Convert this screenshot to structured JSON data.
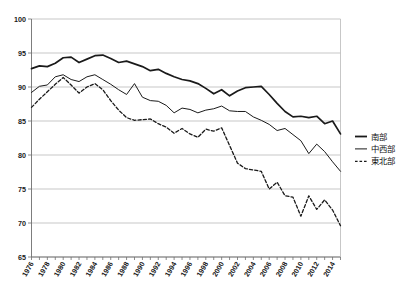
{
  "chart_data": {
    "type": "line",
    "title": "",
    "subtitle": "",
    "xlabel": "",
    "ylabel": "",
    "xlim": [
      1976,
      2015
    ],
    "ylim": [
      65,
      100
    ],
    "y_ticks": [
      65,
      70,
      75,
      80,
      85,
      90,
      95,
      100
    ],
    "grid": true,
    "legend_position": "right",
    "x_tick_labels": [
      "1976",
      "1978",
      "1980",
      "1982",
      "1984",
      "1986",
      "1988",
      "1990",
      "1992",
      "1994",
      "1996",
      "1998",
      "2000",
      "2002",
      "2004",
      "2006",
      "2008",
      "2010",
      "2012",
      "2014"
    ],
    "x": [
      1976,
      1977,
      1978,
      1979,
      1980,
      1981,
      1982,
      1983,
      1984,
      1985,
      1986,
      1987,
      1988,
      1989,
      1990,
      1991,
      1992,
      1993,
      1994,
      1995,
      1996,
      1997,
      1998,
      1999,
      2000,
      2001,
      2002,
      2003,
      2004,
      2005,
      2006,
      2007,
      2008,
      2009,
      2010,
      2011,
      2012,
      2013,
      2014,
      2015
    ],
    "series": [
      {
        "name": "南部",
        "style": "solid-thick",
        "color": "#1a1a1a",
        "values": [
          92.7,
          93.1,
          93.0,
          93.5,
          94.3,
          94.4,
          93.6,
          94.1,
          94.6,
          94.7,
          94.2,
          93.6,
          93.8,
          93.4,
          93.0,
          92.4,
          92.6,
          92.0,
          91.5,
          91.1,
          90.9,
          90.5,
          89.8,
          89.0,
          89.6,
          88.7,
          89.4,
          89.9,
          90.0,
          90.1,
          88.9,
          87.6,
          86.4,
          85.6,
          85.7,
          85.5,
          85.7,
          84.6,
          85.0,
          83.1
        ]
      },
      {
        "name": "中西部",
        "style": "solid-thin",
        "color": "#1a1a1a",
        "values": [
          89.2,
          90.1,
          90.3,
          91.5,
          91.8,
          91.1,
          90.8,
          91.5,
          91.8,
          91.1,
          90.4,
          89.6,
          88.9,
          90.5,
          88.5,
          88.0,
          87.9,
          87.3,
          86.2,
          86.9,
          86.7,
          86.2,
          86.6,
          86.8,
          87.2,
          86.5,
          86.4,
          86.4,
          85.6,
          85.1,
          84.5,
          83.6,
          83.9,
          83.0,
          82.1,
          80.2,
          81.6,
          80.5,
          79.0,
          77.6
        ]
      },
      {
        "name": "東北部",
        "style": "dashed",
        "color": "#1a1a1a",
        "values": [
          87.0,
          88.2,
          89.3,
          90.4,
          91.4,
          90.3,
          89.1,
          90.0,
          90.5,
          89.6,
          88.0,
          86.6,
          85.5,
          85.1,
          85.2,
          85.3,
          84.6,
          84.1,
          83.2,
          83.9,
          83.1,
          82.6,
          83.8,
          83.5,
          84.0,
          81.4,
          78.8,
          78.0,
          77.8,
          77.6,
          75.0,
          76.0,
          74.0,
          73.8,
          71.0,
          74.0,
          72.0,
          73.4,
          71.9,
          69.6
        ]
      }
    ]
  },
  "legend": {
    "items": [
      {
        "label": "南部",
        "style": "solid-thick"
      },
      {
        "label": "中西部",
        "style": "solid-thin"
      },
      {
        "label": "東北部",
        "style": "dashed"
      }
    ]
  }
}
